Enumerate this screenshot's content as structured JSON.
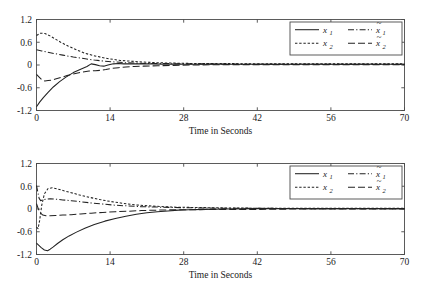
{
  "figure": {
    "background": "#ffffff",
    "ink_color": "#222222",
    "axis_color": "#4a4a4a"
  },
  "chart_data": [
    {
      "type": "line",
      "panel": "top",
      "title": "",
      "xlabel": "Time in Seconds",
      "ylabel": "",
      "xlim": [
        0,
        70
      ],
      "ylim": [
        -1.2,
        1.2
      ],
      "xticks": [
        0,
        14,
        28,
        42,
        56,
        70
      ],
      "xtick_labels": [
        "0",
        "14",
        "28",
        "42",
        "56",
        "70"
      ],
      "yticks": [
        -1.2,
        -0.6,
        0,
        0.6,
        1.2
      ],
      "ytick_labels": [
        "-1.2",
        "-0.6",
        "0",
        "0.6",
        "1.2"
      ],
      "grid": false,
      "legend_position": "upper right",
      "series": [
        {
          "name": "x_1",
          "label": "x",
          "sub": "1",
          "tilde": false,
          "style": "solid",
          "dasharray": "",
          "x": [
            0,
            0.6,
            1.3,
            2.2,
            3.2,
            4.4,
            5.6,
            7.0,
            8.4,
            9.6,
            10.4,
            11.2,
            12.0,
            12.8,
            13.6,
            14.6,
            15.6,
            16.6,
            17.6,
            18.8,
            20.0,
            22.0,
            24.0,
            27.0,
            31.0,
            36.0,
            42.0,
            50.0,
            60.0,
            70.0
          ],
          "y": [
            -1.1,
            -0.98,
            -0.86,
            -0.72,
            -0.58,
            -0.44,
            -0.32,
            -0.2,
            -0.11,
            -0.04,
            0.03,
            0.01,
            -0.02,
            -0.03,
            0.0,
            0.03,
            0.04,
            0.03,
            0.03,
            0.03,
            0.03,
            0.03,
            0.02,
            0.02,
            0.02,
            0.02,
            0.02,
            0.02,
            0.02,
            0.02
          ]
        },
        {
          "name": "x_tilde_1",
          "label": "x",
          "sub": "1",
          "tilde": true,
          "style": "dashdot",
          "dasharray": "6,2.2,1.2,2.2",
          "x": [
            0,
            1.0,
            2.0,
            3.5,
            5.0,
            7.0,
            9.0,
            11.0,
            13.0,
            15.0,
            17.0,
            19.0,
            21.0,
            24.0,
            28.0,
            33.0,
            40.0,
            50.0,
            60.0,
            70.0
          ],
          "y": [
            0.4,
            0.37,
            0.34,
            0.3,
            0.26,
            0.21,
            0.17,
            0.13,
            0.1,
            0.08,
            0.06,
            0.05,
            0.04,
            0.04,
            0.03,
            0.03,
            0.02,
            0.02,
            0.02,
            0.02
          ]
        },
        {
          "name": "x_2",
          "label": "x",
          "sub": "2",
          "tilde": false,
          "style": "dotted",
          "dasharray": "2.4,1.8",
          "x": [
            0,
            0.8,
            1.6,
            2.4,
            3.4,
            4.6,
            6.0,
            7.6,
            9.2,
            10.8,
            12.4,
            14.0,
            16.0,
            18.0,
            20.0,
            23.0,
            26.0,
            30.0,
            35.0,
            42.0,
            50.0,
            60.0,
            70.0
          ],
          "y": [
            0.78,
            0.84,
            0.83,
            0.78,
            0.7,
            0.6,
            0.5,
            0.4,
            0.31,
            0.25,
            0.2,
            0.16,
            0.12,
            0.1,
            0.08,
            0.06,
            0.05,
            0.04,
            0.04,
            0.03,
            0.03,
            0.03,
            0.03
          ]
        },
        {
          "name": "x_tilde_2",
          "label": "x",
          "sub": "2",
          "tilde": true,
          "style": "longdash",
          "dasharray": "7,3",
          "x": [
            0,
            0.5,
            1.0,
            1.6,
            2.2,
            2.8,
            3.6,
            4.6,
            5.8,
            7.2,
            8.6,
            10.0,
            11.2,
            12.2,
            13.2,
            14.4,
            15.6,
            17.0,
            18.6,
            20.4,
            23.0,
            26.0,
            30.0,
            36.0,
            44.0,
            55.0,
            70.0
          ],
          "y": [
            -0.25,
            -0.32,
            -0.39,
            -0.42,
            -0.41,
            -0.4,
            -0.37,
            -0.33,
            -0.28,
            -0.23,
            -0.19,
            -0.16,
            -0.15,
            -0.14,
            -0.12,
            -0.09,
            -0.07,
            -0.05,
            -0.04,
            -0.03,
            -0.02,
            -0.01,
            0.0,
            0.01,
            0.01,
            0.01,
            0.01
          ]
        }
      ]
    },
    {
      "type": "line",
      "panel": "bottom",
      "title": "",
      "xlabel": "Time in Seconds",
      "ylabel": "",
      "xlim": [
        0,
        70
      ],
      "ylim": [
        -1.2,
        1.2
      ],
      "xticks": [
        0,
        14,
        28,
        42,
        56,
        70
      ],
      "xtick_labels": [
        "0",
        "14",
        "28",
        "42",
        "56",
        "70"
      ],
      "yticks": [
        -1.2,
        -0.6,
        0,
        0.6,
        1.2
      ],
      "ytick_labels": [
        "-1.2",
        "-0.6",
        "0",
        "0.6",
        "1.2"
      ],
      "grid": false,
      "legend_position": "upper right",
      "series": [
        {
          "name": "x_1",
          "label": "x",
          "sub": "1",
          "tilde": false,
          "style": "solid",
          "dasharray": "",
          "x": [
            0,
            0.4,
            0.9,
            1.5,
            2.1,
            2.6,
            3.2,
            4.0,
            5.0,
            6.2,
            7.6,
            9.2,
            11.0,
            13.0,
            15.0,
            17.0,
            19.0,
            21.0,
            23.0,
            25.0,
            27.0,
            29.0,
            32.0,
            36.0,
            42.0,
            50.0,
            60.0,
            70.0
          ],
          "y": [
            -0.9,
            -0.95,
            -1.02,
            -1.08,
            -1.1,
            -1.06,
            -1.0,
            -0.91,
            -0.81,
            -0.71,
            -0.61,
            -0.51,
            -0.41,
            -0.32,
            -0.25,
            -0.19,
            -0.14,
            -0.1,
            -0.07,
            -0.05,
            -0.03,
            -0.02,
            -0.01,
            0.0,
            0.01,
            0.01,
            0.01,
            0.01
          ]
        },
        {
          "name": "x_tilde_1",
          "label": "x",
          "sub": "1",
          "tilde": true,
          "style": "dashdot",
          "dasharray": "6,2.2,1.2,2.2",
          "x": [
            0,
            0.25,
            0.5,
            0.8,
            1.2,
            1.8,
            2.6,
            3.6,
            5.0,
            6.6,
            8.4,
            10.4,
            12.6,
            15.0,
            17.5,
            20.0,
            23.0,
            26.0,
            30.0,
            35.0,
            42.0,
            50.0,
            60.0,
            70.0
          ],
          "y": [
            0.62,
            0.45,
            0.28,
            0.22,
            0.24,
            0.26,
            0.27,
            0.26,
            0.24,
            0.22,
            0.19,
            0.16,
            0.13,
            0.1,
            0.08,
            0.06,
            0.05,
            0.04,
            0.03,
            0.02,
            0.02,
            0.01,
            0.01,
            0.01
          ]
        },
        {
          "name": "x_2",
          "label": "x",
          "sub": "2",
          "tilde": false,
          "style": "dotted",
          "dasharray": "2.4,1.8",
          "x": [
            0,
            0.3,
            0.6,
            1.0,
            1.5,
            2.2,
            3.0,
            4.0,
            5.2,
            6.6,
            8.2,
            10.0,
            12.0,
            14.0,
            16.0,
            18.0,
            20.5,
            23.0,
            26.0,
            30.0,
            35.0,
            42.0,
            50.0,
            60.0,
            70.0
          ],
          "y": [
            -0.48,
            -0.52,
            -0.3,
            0.1,
            0.4,
            0.54,
            0.56,
            0.53,
            0.48,
            0.43,
            0.37,
            0.31,
            0.25,
            0.2,
            0.16,
            0.12,
            0.09,
            0.07,
            0.05,
            0.04,
            0.03,
            0.02,
            0.02,
            0.02,
            0.02
          ]
        },
        {
          "name": "x_tilde_2",
          "label": "x",
          "sub": "2",
          "tilde": true,
          "style": "longdash",
          "dasharray": "7,3",
          "x": [
            0,
            0.3,
            0.7,
            1.2,
            1.8,
            2.6,
            3.6,
            5.0,
            6.6,
            8.4,
            10.4,
            12.6,
            15.0,
            17.5,
            20.0,
            23.0,
            26.0,
            30.0,
            35.0,
            42.0,
            50.0,
            60.0,
            70.0
          ],
          "y": [
            0.14,
            0.02,
            -0.1,
            -0.16,
            -0.18,
            -0.18,
            -0.17,
            -0.16,
            -0.15,
            -0.13,
            -0.11,
            -0.09,
            -0.07,
            -0.06,
            -0.04,
            -0.03,
            -0.02,
            -0.02,
            -0.01,
            -0.01,
            0.0,
            0.0,
            0.0
          ]
        }
      ]
    }
  ]
}
